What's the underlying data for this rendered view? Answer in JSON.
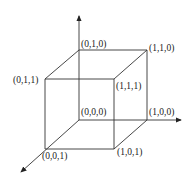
{
  "diagram": {
    "type": "unit-cube-3d-axes",
    "vertices": [
      {
        "id": "v000",
        "label": "(0,0,0)"
      },
      {
        "id": "v100",
        "label": "(1,0,0)"
      },
      {
        "id": "v010",
        "label": "(0,1,0)"
      },
      {
        "id": "v110",
        "label": "(1,1,0)"
      },
      {
        "id": "v001",
        "label": "(0,0,1)"
      },
      {
        "id": "v101",
        "label": "(1,0,1)"
      },
      {
        "id": "v011",
        "label": "(0,1,1)"
      },
      {
        "id": "v111",
        "label": "(1,1,1)"
      }
    ],
    "axes": [
      "x-axis",
      "y-axis",
      "z-axis"
    ],
    "line_color": "#333333"
  }
}
